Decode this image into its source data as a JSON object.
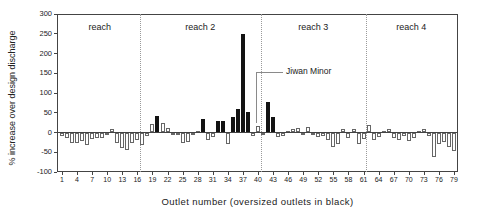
{
  "chart_data": {
    "type": "bar",
    "title": "",
    "xlabel": "Outlet number  (oversized outlets in black)",
    "ylabel": "% increase over design discharge",
    "ylim": [
      -100,
      300
    ],
    "yticks": [
      300,
      250,
      200,
      150,
      100,
      50,
      0,
      -50,
      -100
    ],
    "xticks": [
      1,
      4,
      7,
      10,
      13,
      16,
      19,
      22,
      25,
      28,
      31,
      34,
      37,
      40,
      43,
      46,
      49,
      52,
      55,
      58,
      61,
      64,
      67,
      70,
      73,
      76,
      79
    ],
    "x": [
      1,
      2,
      3,
      4,
      5,
      6,
      7,
      8,
      9,
      10,
      11,
      12,
      13,
      14,
      15,
      16,
      17,
      18,
      19,
      20,
      21,
      22,
      23,
      24,
      25,
      26,
      27,
      28,
      29,
      30,
      31,
      32,
      33,
      34,
      35,
      36,
      37,
      38,
      39,
      40,
      41,
      42,
      43,
      44,
      45,
      46,
      47,
      48,
      49,
      50,
      51,
      52,
      53,
      54,
      55,
      56,
      57,
      58,
      59,
      60,
      61,
      62,
      63,
      64,
      65,
      66,
      67,
      68,
      69,
      70,
      71,
      72,
      73,
      74,
      75,
      76,
      77,
      78,
      79
    ],
    "values": [
      -8,
      -14,
      -26,
      -27,
      -21,
      -31,
      -17,
      -13,
      -15,
      -4,
      8,
      -26,
      -38,
      -45,
      -26,
      -20,
      -31,
      -9,
      21,
      42,
      23,
      12,
      -6,
      -4,
      -27,
      -25,
      -4,
      5,
      34,
      -18,
      -11,
      28,
      30,
      -30,
      39,
      60,
      250,
      52,
      -9,
      16,
      -4,
      78,
      39,
      -12,
      -8,
      5,
      8,
      12,
      -6,
      15,
      -6,
      -12,
      -8,
      -20,
      -36,
      -30,
      8,
      -14,
      9,
      -28,
      -16,
      19,
      -20,
      -11,
      5,
      9,
      -15,
      -18,
      -10,
      -21,
      -13,
      4,
      9,
      -8,
      -62,
      -30,
      -24,
      -36,
      -46
    ],
    "oversized_outlets": [
      20,
      29,
      32,
      33,
      35,
      36,
      37,
      38,
      42,
      43
    ],
    "bar_colors": {
      "normal": "#ffffff",
      "oversized": "#131313"
    },
    "reaches": [
      {
        "label": "reach",
        "from": 1,
        "to": 16
      },
      {
        "label": "reach 2",
        "from": 17,
        "to": 40
      },
      {
        "label": "reach 3",
        "from": 41,
        "to": 61
      },
      {
        "label": "reach 4",
        "from": 62,
        "to": 79
      }
    ],
    "annotation": {
      "text": "Jiwan Minor",
      "outlet": 40
    },
    "grid": false,
    "legend": false
  }
}
